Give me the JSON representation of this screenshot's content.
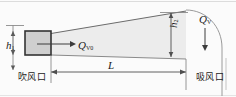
{
  "figure": {
    "kind": "engineering-schematic",
    "labels": {
      "h1": {
        "symbol": "h",
        "subscript": "1",
        "text": "h1"
      },
      "h2": {
        "symbol": "h",
        "subscript": "2",
        "text": "h2"
      },
      "L": {
        "symbol": "L",
        "subscript": "",
        "text": "L"
      },
      "qv0": {
        "symbol": "Q",
        "subscript": "V0",
        "text": "QV0"
      },
      "qv": {
        "symbol": "Q",
        "subscript": "V",
        "text": "QV"
      },
      "blow_port": "吹风口",
      "suction_port": "吸风口"
    },
    "colors": {
      "jet_fill": "#ebebeb",
      "nozzle_fill": "#cfcfcf",
      "nozzle_stroke": "#333333",
      "line": "#4d4d4d",
      "frame": "#d8d8d8",
      "background": "#fbfbfb"
    }
  }
}
